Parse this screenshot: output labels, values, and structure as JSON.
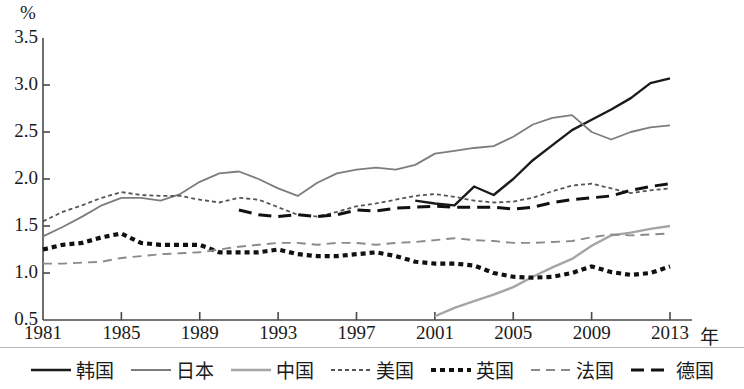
{
  "chart_data": {
    "type": "line",
    "title": "",
    "subtitle": "",
    "xlabel": "年",
    "ylabel": "%",
    "xlim": [
      1981,
      2013
    ],
    "ylim": [
      0.5,
      3.5
    ],
    "grid": false,
    "legend_position": "bottom",
    "x": [
      1981,
      1982,
      1983,
      1984,
      1985,
      1986,
      1987,
      1988,
      1989,
      1990,
      1991,
      1992,
      1993,
      1994,
      1995,
      1996,
      1997,
      1998,
      1999,
      2000,
      2001,
      2002,
      2003,
      2004,
      2005,
      2006,
      2007,
      2008,
      2009,
      2010,
      2011,
      2012,
      2013
    ],
    "xticks": [
      1981,
      1985,
      1989,
      1993,
      1997,
      2001,
      2005,
      2009,
      2013
    ],
    "yticks": [
      0.5,
      1.0,
      1.5,
      2.0,
      2.5,
      3.0,
      3.5
    ],
    "series": [
      {
        "name": "韩国",
        "style": "solid",
        "color": "#1a1a1a",
        "width": 2.4,
        "x": [
          2000,
          2001,
          2002,
          2003,
          2004,
          2005,
          2006,
          2007,
          2008,
          2009,
          2010,
          2011,
          2012,
          2013
        ],
        "values": [
          1.77,
          1.74,
          1.72,
          1.92,
          1.83,
          2.0,
          2.2,
          2.36,
          2.52,
          2.63,
          2.74,
          2.86,
          3.02,
          3.07
        ]
      },
      {
        "name": "日本",
        "style": "solid",
        "color": "#7d7d7d",
        "width": 1.8,
        "x": [
          1981,
          1982,
          1983,
          1984,
          1985,
          1986,
          1987,
          1988,
          1989,
          1990,
          1991,
          1992,
          1993,
          1994,
          1995,
          1996,
          1997,
          1998,
          1999,
          2000,
          2001,
          2002,
          2003,
          2004,
          2005,
          2006,
          2007,
          2008,
          2009,
          2010,
          2011,
          2012,
          2013
        ],
        "values": [
          1.39,
          1.49,
          1.6,
          1.72,
          1.8,
          1.8,
          1.77,
          1.84,
          1.97,
          2.06,
          2.08,
          2.0,
          1.9,
          1.82,
          1.96,
          2.06,
          2.1,
          2.12,
          2.1,
          2.15,
          2.27,
          2.3,
          2.33,
          2.35,
          2.45,
          2.58,
          2.65,
          2.68,
          2.5,
          2.42,
          2.5,
          2.55,
          2.57
        ]
      },
      {
        "name": "中国",
        "style": "solid",
        "color": "#a5a5a5",
        "width": 2.4,
        "x": [
          2001,
          2002,
          2003,
          2004,
          2005,
          2006,
          2007,
          2008,
          2009,
          2010,
          2011,
          2012,
          2013
        ],
        "values": [
          0.54,
          0.63,
          0.7,
          0.77,
          0.85,
          0.96,
          1.06,
          1.15,
          1.29,
          1.4,
          1.43,
          1.47,
          1.5
        ]
      },
      {
        "name": "美国",
        "style": "dotted-fine",
        "color": "#555555",
        "width": 1.8,
        "x": [
          1981,
          1982,
          1983,
          1984,
          1985,
          1986,
          1987,
          1988,
          1989,
          1990,
          1991,
          1992,
          1993,
          1994,
          1995,
          1996,
          1997,
          1998,
          1999,
          2000,
          2001,
          2002,
          2003,
          2004,
          2005,
          2006,
          2007,
          2008,
          2009,
          2010,
          2011,
          2012,
          2013
        ],
        "values": [
          1.55,
          1.65,
          1.72,
          1.8,
          1.86,
          1.83,
          1.82,
          1.82,
          1.78,
          1.75,
          1.8,
          1.78,
          1.7,
          1.62,
          1.6,
          1.65,
          1.71,
          1.74,
          1.78,
          1.82,
          1.84,
          1.81,
          1.77,
          1.75,
          1.76,
          1.8,
          1.87,
          1.93,
          1.95,
          1.9,
          1.85,
          1.88,
          1.9
        ]
      },
      {
        "name": "英国",
        "style": "thick-dotted",
        "color": "#111111",
        "width": 4.2,
        "x": [
          1981,
          1982,
          1983,
          1984,
          1985,
          1986,
          1987,
          1988,
          1989,
          1990,
          1991,
          1992,
          1993,
          1994,
          1995,
          1996,
          1997,
          1998,
          1999,
          2000,
          2001,
          2002,
          2003,
          2004,
          2005,
          2006,
          2007,
          2008,
          2009,
          2010,
          2011,
          2012,
          2013
        ],
        "values": [
          1.25,
          1.3,
          1.32,
          1.38,
          1.42,
          1.32,
          1.3,
          1.3,
          1.3,
          1.22,
          1.22,
          1.22,
          1.25,
          1.2,
          1.18,
          1.18,
          1.2,
          1.22,
          1.18,
          1.12,
          1.1,
          1.1,
          1.08,
          1.0,
          0.96,
          0.95,
          0.96,
          1.0,
          1.07,
          1.01,
          0.98,
          1.0,
          1.07
        ]
      },
      {
        "name": "法国",
        "style": "dashed",
        "color": "#8a8a8a",
        "width": 1.9,
        "x": [
          1981,
          1982,
          1983,
          1984,
          1985,
          1986,
          1987,
          1988,
          1989,
          1990,
          1991,
          1992,
          1993,
          1994,
          1995,
          1996,
          1997,
          1998,
          1999,
          2000,
          2001,
          2002,
          2003,
          2004,
          2005,
          2006,
          2007,
          2008,
          2009,
          2010,
          2011,
          2012,
          2013
        ],
        "values": [
          1.1,
          1.1,
          1.11,
          1.12,
          1.16,
          1.18,
          1.2,
          1.21,
          1.22,
          1.25,
          1.28,
          1.3,
          1.32,
          1.32,
          1.3,
          1.32,
          1.32,
          1.3,
          1.32,
          1.33,
          1.35,
          1.37,
          1.35,
          1.34,
          1.32,
          1.32,
          1.33,
          1.34,
          1.38,
          1.41,
          1.4,
          1.41,
          1.42
        ]
      },
      {
        "name": "德国",
        "style": "bold-dashed",
        "color": "#111111",
        "width": 3.0,
        "x": [
          1991,
          1992,
          1993,
          1994,
          1995,
          1996,
          1997,
          1998,
          1999,
          2000,
          2001,
          2002,
          2003,
          2004,
          2005,
          2006,
          2007,
          2008,
          2009,
          2010,
          2011,
          2012,
          2013
        ],
        "values": [
          1.67,
          1.62,
          1.6,
          1.62,
          1.6,
          1.62,
          1.67,
          1.66,
          1.69,
          1.7,
          1.71,
          1.7,
          1.7,
          1.7,
          1.68,
          1.7,
          1.75,
          1.78,
          1.8,
          1.82,
          1.88,
          1.92,
          1.95
        ]
      }
    ]
  },
  "axes": {
    "y_unit": "%",
    "x_unit": "年",
    "ytick_labels": [
      "3.5",
      "3.0",
      "2.5",
      "2.0",
      "1.5",
      "1.0",
      "0.5"
    ],
    "xtick_labels": [
      "1981",
      "1985",
      "1989",
      "1993",
      "1997",
      "2001",
      "2005",
      "2009",
      "2013"
    ]
  },
  "legend": {
    "items": [
      {
        "label": "韩国",
        "key": "solid-black-key"
      },
      {
        "label": "日本",
        "key": "solid-gray-key"
      },
      {
        "label": "中国",
        "key": "solid-lightgray-key"
      },
      {
        "label": "美国",
        "key": "fine-dashed-key"
      },
      {
        "label": "英国",
        "key": "thick-dotted-key"
      },
      {
        "label": "法国",
        "key": "dashed-gray-key"
      },
      {
        "label": "德国",
        "key": "bold-dashed-key"
      }
    ]
  }
}
